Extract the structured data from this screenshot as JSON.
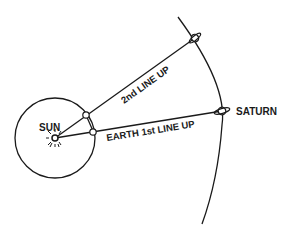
{
  "diagram": {
    "type": "orbital-alignment",
    "labels": {
      "sun": "SUN",
      "saturn": "SATURN",
      "line_second": "2nd LINE UP",
      "line_first": "EARTH 1st LINE UP"
    },
    "colors": {
      "ink": "#1a1a1a",
      "background": "#ffffff"
    }
  }
}
